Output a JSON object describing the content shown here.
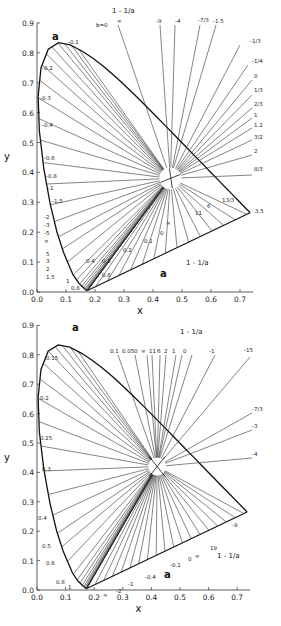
{
  "figure": {
    "plots": [
      {
        "id": "top",
        "xlabel": "x",
        "ylabel": "y",
        "x_ticks": [
          "0.0",
          "0.1",
          "0.2",
          "0.3",
          "0.4",
          "0.5",
          "0.6",
          "0.7"
        ],
        "y_ticks": [
          "0.0",
          "0.1",
          "0.2",
          "0.3",
          "0.4",
          "0.5",
          "0.6",
          "0.7",
          "0.8",
          "0.9"
        ],
        "label_a_upper": "a",
        "label_a_lower": "a",
        "label_b0": "b=0",
        "label_one_minus_inv_a_top": "1 - 1/a",
        "label_one_minus_inv_a_bottom": "1 - 1/a",
        "locus_labels": [
          "-0.1",
          "-0.2",
          "-0.3",
          "-0.4",
          "-0.6",
          "-0.8",
          "-1",
          "-1.5",
          "-2",
          "-3",
          "-5",
          "∞",
          "5",
          "3",
          "2",
          "1.5",
          "1",
          "0.8"
        ],
        "purple_line_labels": [
          "0.6",
          "0.4",
          "0.3",
          "0.2",
          "0.1",
          "0",
          "∞",
          "11",
          "6",
          "13/3",
          "3.5"
        ],
        "top_labels": [
          "∞",
          "-9",
          "-4",
          "-7/3",
          "-1.5",
          "-1/3",
          "-1/4",
          "0",
          "1/3",
          "2/3",
          "1",
          "1.2",
          "3/2",
          "2",
          "8/3"
        ]
      },
      {
        "id": "bottom",
        "xlabel": "x",
        "ylabel": "y",
        "x_ticks": [
          "0.0",
          "0.1",
          "0.2",
          "0.3",
          "0.4",
          "0.5",
          "0.6",
          "0.7"
        ],
        "y_ticks": [
          "0.0",
          "0.1",
          "0.2",
          "0.3",
          "0.4",
          "0.5",
          "0.6",
          "0.7",
          "0.8",
          "0.9"
        ],
        "label_a_upper": "a",
        "label_a_lower": "a",
        "label_one_minus_inv_a_top": "1 - 1/a",
        "label_one_minus_inv_a_bottom": "1 - 1/a",
        "locus_labels": [
          "0.15",
          "0.2",
          "0.25",
          "0.3",
          "0.4",
          "0.5",
          "0.6",
          "0.8",
          "1"
        ],
        "purple_line_labels": [
          "∞",
          "-2",
          "-1",
          "-0.4",
          "-0.1",
          "0",
          "∞",
          "19",
          "-9"
        ],
        "top_labels": [
          "0.1",
          "0.05",
          "0",
          "∞",
          "11",
          "6",
          "2",
          "1",
          "0",
          "-1",
          "-15",
          "-7/3",
          "-3",
          "-4"
        ]
      }
    ]
  }
}
